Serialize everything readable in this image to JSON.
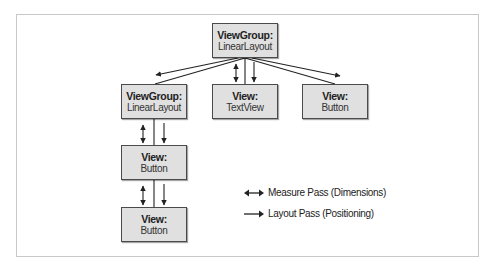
{
  "diagram": {
    "title": "",
    "nodes": [
      {
        "id": "root",
        "kind": "ViewGroup:",
        "class": "LinearLayout"
      },
      {
        "id": "child-linearlayout",
        "kind": "ViewGroup:",
        "class": "LinearLayout"
      },
      {
        "id": "child-textview",
        "kind": "View:",
        "class": "TextView"
      },
      {
        "id": "child-button",
        "kind": "View:",
        "class": "Button"
      },
      {
        "id": "grandchild-button-1",
        "kind": "View:",
        "class": "Button"
      },
      {
        "id": "grandchild-button-2",
        "kind": "View:",
        "class": "Button"
      }
    ],
    "edges": [
      {
        "from": "root",
        "to": "child-linearlayout"
      },
      {
        "from": "root",
        "to": "child-textview"
      },
      {
        "from": "root",
        "to": "child-button"
      },
      {
        "from": "child-linearlayout",
        "to": "grandchild-button-1"
      },
      {
        "from": "grandchild-button-1",
        "to": "grandchild-button-2"
      }
    ],
    "legend": [
      {
        "icon": "double-arrow-icon",
        "label": "Measure Pass (Dimensions)"
      },
      {
        "icon": "right-arrow-icon",
        "label": "Layout Pass (Positioning)"
      }
    ],
    "colors": {
      "node_fill": "#e0e0e0",
      "node_border": "#4a4a4a",
      "line": "#222222",
      "frame": "#c8c8c8"
    }
  }
}
